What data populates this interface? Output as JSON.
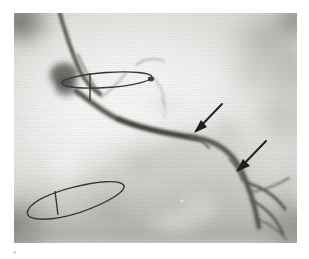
{
  "figure": {
    "modality": "coronary angiogram",
    "caption_mark": "a",
    "plate": {
      "x": 14,
      "y": 13,
      "width": 283,
      "height": 230,
      "background_hex": "#f4f4f2"
    }
  },
  "annotations": {
    "arrows": [
      {
        "name": "stenosis-arrow-upper",
        "label": "",
        "tail_x": 222,
        "tail_y": 104,
        "tip_x": 194,
        "tip_y": 131,
        "color_hex": "#111111",
        "points": "down-left"
      },
      {
        "name": "stenosis-arrow-lower",
        "label": "",
        "tail_x": 266,
        "tail_y": 141,
        "tip_x": 235,
        "tip_y": 170,
        "color_hex": "#111111",
        "points": "down-left"
      }
    ],
    "markers": [
      {
        "name": "marker-ellipse-upper",
        "label": "",
        "cx": 93,
        "cy": 67,
        "rx": 45,
        "ry": 8,
        "rotation_deg": -4,
        "tick": true,
        "color_hex": "#2b2b2b"
      },
      {
        "name": "marker-ellipse-lower",
        "label": "",
        "cx": 62,
        "cy": 189,
        "rx": 50,
        "ry": 12,
        "rotation_deg": -12,
        "tick": true,
        "color_hex": "#2b2b2b"
      }
    ]
  },
  "anatomy": {
    "vessel_name": "",
    "catheter_present": true,
    "vessel_path": "M 60 78 C 74 86, 86 96, 100 104 C 122 114, 150 119, 182 124 C 205 128, 218 140, 226 156 C 234 172, 240 192, 244 212",
    "catheter_path": "M 44 0 C 50 16, 58 40, 66 58 C 72 70, 78 76, 84 80",
    "branch_paths": [
      "M 232 168 C 248 172, 262 180, 272 194",
      "M 238 186 C 252 192, 264 204, 270 220",
      "M 236 178 C 250 178, 264 172, 276 166"
    ]
  },
  "colors": {
    "page_background": "#ffffff",
    "ink": "#111111",
    "plate_light": "#fbfbfa",
    "plate_mid": "#cfcfca",
    "plate_dark": "#6f6f6a",
    "vessel": "#4a4a46"
  }
}
